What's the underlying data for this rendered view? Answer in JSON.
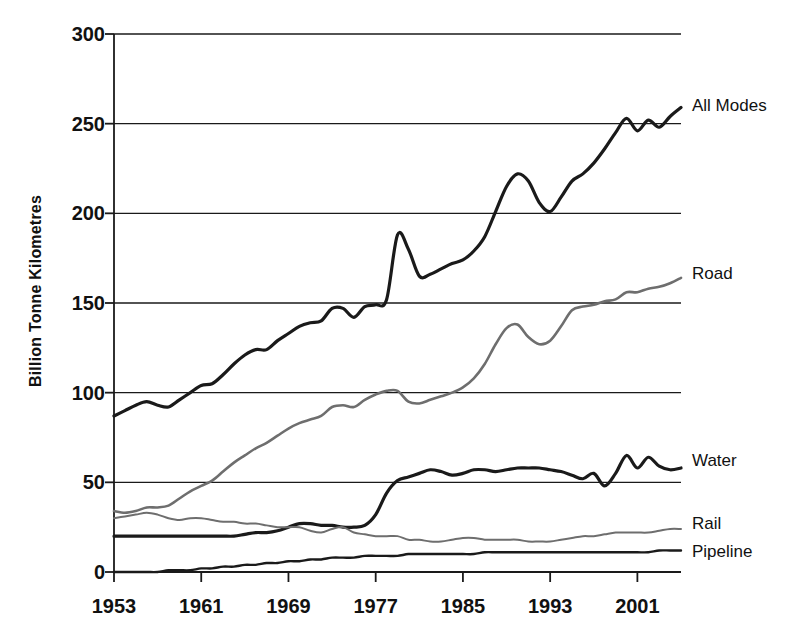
{
  "chart_data": {
    "type": "line",
    "title": "",
    "subtitle": "",
    "xlabel": "",
    "ylabel": "Billion Tonne Kilometres",
    "xlim": [
      1953,
      2005
    ],
    "ylim": [
      0,
      300
    ],
    "grid": "horizontal",
    "legend_position": "right-of-plot-inline",
    "y_ticks": [
      0,
      50,
      100,
      150,
      200,
      250,
      300
    ],
    "y_tick_labels": [
      "0",
      "50",
      "100",
      "150",
      "200",
      "250",
      "300"
    ],
    "x_ticks": [
      1953,
      1961,
      1969,
      1977,
      1985,
      1993,
      2001
    ],
    "x_tick_labels": [
      "1953",
      "1961",
      "1969",
      "1977",
      "1985",
      "1993",
      "2001"
    ],
    "x": [
      1953,
      1954,
      1955,
      1956,
      1957,
      1958,
      1959,
      1960,
      1961,
      1962,
      1963,
      1964,
      1965,
      1966,
      1967,
      1968,
      1969,
      1970,
      1971,
      1972,
      1973,
      1974,
      1975,
      1976,
      1977,
      1978,
      1979,
      1980,
      1981,
      1982,
      1983,
      1984,
      1985,
      1986,
      1987,
      1988,
      1989,
      1990,
      1991,
      1992,
      1993,
      1994,
      1995,
      1996,
      1997,
      1998,
      1999,
      2000,
      2001,
      2002,
      2003,
      2004,
      2005
    ],
    "series": [
      {
        "name": "All Modes",
        "color": "#1a1a1a",
        "width": 3.2,
        "label_value": "All Modes",
        "values": [
          87,
          90,
          93,
          95,
          93,
          92,
          96,
          100,
          104,
          105,
          110,
          116,
          121,
          124,
          124,
          129,
          133,
          137,
          139,
          140,
          147,
          147,
          142,
          148,
          149,
          152,
          188,
          180,
          165,
          166,
          169,
          172,
          174,
          179,
          187,
          201,
          215,
          222,
          218,
          206,
          201,
          209,
          218,
          222,
          228,
          236,
          245,
          253,
          246,
          252,
          248,
          254,
          259
        ]
      },
      {
        "name": "Road",
        "color": "#6e6e6e",
        "width": 2.6,
        "label_value": "Road",
        "values": [
          34,
          33,
          34,
          36,
          36,
          37,
          41,
          45,
          48,
          51,
          56,
          61,
          65,
          69,
          72,
          76,
          80,
          83,
          85,
          87,
          92,
          93,
          92,
          96,
          99,
          101,
          101,
          95,
          94,
          96,
          98,
          100,
          103,
          108,
          116,
          127,
          136,
          138,
          131,
          127,
          129,
          137,
          146,
          148,
          149,
          151,
          152,
          156,
          156,
          158,
          159,
          161,
          164
        ]
      },
      {
        "name": "Water",
        "color": "#1a1a1a",
        "width": 3.2,
        "label_value": "Water",
        "values": [
          20,
          20,
          20,
          20,
          20,
          20,
          20,
          20,
          20,
          20,
          20,
          20,
          21,
          22,
          22,
          23,
          25,
          27,
          27,
          26,
          26,
          25,
          25,
          26,
          32,
          44,
          51,
          53,
          55,
          57,
          56,
          54,
          55,
          57,
          57,
          56,
          57,
          58,
          58,
          58,
          57,
          56,
          54,
          52,
          55,
          48,
          55,
          65,
          58,
          64,
          59,
          57,
          58
        ]
      },
      {
        "name": "Rail",
        "color": "#6e6e6e",
        "width": 2.0,
        "label_value": "Rail",
        "values": [
          30,
          31,
          32,
          33,
          32,
          30,
          29,
          30,
          30,
          29,
          28,
          28,
          27,
          27,
          26,
          25,
          25,
          25,
          23,
          22,
          24,
          25,
          22,
          21,
          20,
          20,
          20,
          18,
          18,
          17,
          17,
          18,
          19,
          19,
          18,
          18,
          18,
          18,
          17,
          17,
          17,
          18,
          19,
          20,
          20,
          21,
          22,
          22,
          22,
          22,
          23,
          24,
          24
        ]
      },
      {
        "name": "Pipeline",
        "color": "#1a1a1a",
        "width": 2.4,
        "label_value": "Pipeline",
        "values": [
          0,
          0,
          0,
          0,
          0,
          1,
          1,
          1,
          2,
          2,
          3,
          3,
          4,
          4,
          5,
          5,
          6,
          6,
          7,
          7,
          8,
          8,
          8,
          9,
          9,
          9,
          9,
          10,
          10,
          10,
          10,
          10,
          10,
          10,
          11,
          11,
          11,
          11,
          11,
          11,
          11,
          11,
          11,
          11,
          11,
          11,
          11,
          11,
          11,
          11,
          12,
          12,
          12
        ]
      }
    ],
    "series_labels": [
      {
        "text": "All Modes",
        "y_value": 260
      },
      {
        "text": "Road",
        "y_value": 166
      },
      {
        "text": "Water",
        "y_value": 62
      },
      {
        "text": "Rail",
        "y_value": 27
      },
      {
        "text": "Pipeline",
        "y_value": 11
      }
    ]
  },
  "colors": {
    "ink": "#1a1a1a",
    "gray_series": "#6e6e6e",
    "background": "#ffffff"
  }
}
